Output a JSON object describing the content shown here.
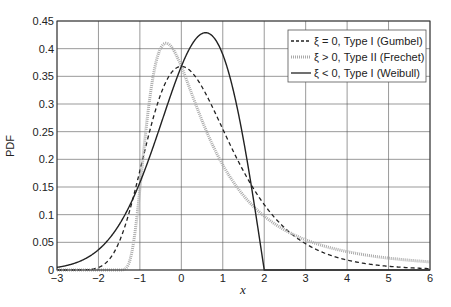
{
  "chart_data": {
    "type": "line",
    "title": "",
    "xlabel": "x",
    "ylabel": "PDF",
    "xlim": [
      -3,
      6
    ],
    "ylim": [
      0,
      0.45
    ],
    "xticks": [
      -3,
      -2,
      -1,
      0,
      1,
      2,
      3,
      4,
      5,
      6
    ],
    "xtick_labels": [
      "−3",
      "−2",
      "−1",
      "0",
      "1",
      "2",
      "3",
      "4",
      "5",
      "6"
    ],
    "yticks": [
      0,
      0.05,
      0.1,
      0.15,
      0.2,
      0.25,
      0.3,
      0.35,
      0.4,
      0.45
    ],
    "ytick_labels": [
      "0",
      "0.05",
      "0.1",
      "0.15",
      "0.2",
      "0.25",
      "0.3",
      "0.35",
      "0.4",
      "0.45"
    ],
    "grid": true,
    "legend_position": "upper right",
    "series": [
      {
        "name": "ξ = 0, Type I (Gumbel)",
        "xi": 0,
        "style": "dashed",
        "color": "#222222",
        "peak": {
          "x": 0.0,
          "y": 0.368
        },
        "points": [
          [
            -3,
            0.0
          ],
          [
            -2,
            0.005
          ],
          [
            -1.5,
            0.05
          ],
          [
            -1,
            0.179
          ],
          [
            -0.5,
            0.319
          ],
          [
            0,
            0.368
          ],
          [
            0.5,
            0.331
          ],
          [
            1,
            0.254
          ],
          [
            1.5,
            0.177
          ],
          [
            2,
            0.118
          ],
          [
            3,
            0.047
          ],
          [
            4,
            0.018
          ],
          [
            5,
            0.007
          ],
          [
            6,
            0.002
          ]
        ]
      },
      {
        "name": "ξ > 0, Type II (Frechet)",
        "xi": 0.5,
        "style": "dotted-thick",
        "color": "#aaaaaa",
        "peak": {
          "x": -0.37,
          "y": 0.41
        },
        "points": [
          [
            -2,
            0.0
          ],
          [
            -1.5,
            0.0
          ],
          [
            -1.2,
            0.02
          ],
          [
            -1,
            0.147
          ],
          [
            -0.5,
            0.402
          ],
          [
            -0.37,
            0.41
          ],
          [
            0,
            0.368
          ],
          [
            0.5,
            0.279
          ],
          [
            1,
            0.212
          ],
          [
            1.5,
            0.163
          ],
          [
            2,
            0.127
          ],
          [
            3,
            0.08
          ],
          [
            4,
            0.053
          ],
          [
            5,
            0.037
          ],
          [
            6,
            0.026
          ]
        ]
      },
      {
        "name": "ξ < 0, Type I (Weibull)",
        "xi": -0.5,
        "style": "solid",
        "color": "#222222",
        "peak": {
          "x": 0.59,
          "y": 0.429
        },
        "points": [
          [
            -3,
            0.005
          ],
          [
            -2,
            0.05
          ],
          [
            -1,
            0.158
          ],
          [
            0,
            0.368
          ],
          [
            0.59,
            0.429
          ],
          [
            1,
            0.389
          ],
          [
            1.5,
            0.221
          ],
          [
            2,
            0.0
          ],
          [
            3,
            0.0
          ],
          [
            6,
            0.0
          ]
        ]
      }
    ]
  },
  "legend": {
    "items": [
      {
        "label": "ξ = 0, Type I (Gumbel)"
      },
      {
        "label": "ξ > 0, Type II (Frechet)"
      },
      {
        "label": "ξ < 0, Type I (Weibull)"
      }
    ]
  },
  "axes": {
    "xlabel": "x",
    "ylabel": "PDF"
  }
}
